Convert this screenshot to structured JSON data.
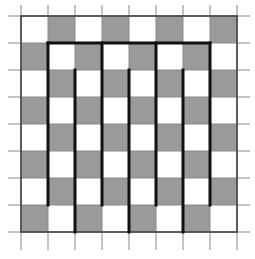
{
  "diagram": {
    "type": "checkerboard-with-meander-path",
    "rows": 8,
    "cols": 8,
    "origin": {
      "x": 21,
      "y": 16
    },
    "cell_size": 27,
    "tick_extent": {
      "x_min": 8,
      "x_max": 250,
      "y_min": 5,
      "y_max": 250
    },
    "colors": {
      "light_cell": "#ffffff",
      "dark_cell": "#9a9a9a",
      "grid_line": "#8a8a8a",
      "border_line": "#444444",
      "path_line": "#111111"
    },
    "dark_rule": "(row + col) is odd",
    "path_segments": [
      {
        "x1": 1,
        "y1": 1,
        "x2": 7,
        "y2": 1
      },
      {
        "x1": 1,
        "y1": 1,
        "x2": 1,
        "y2": 7
      },
      {
        "x1": 3,
        "y1": 1,
        "x2": 3,
        "y2": 7
      },
      {
        "x1": 5,
        "y1": 1,
        "x2": 5,
        "y2": 7
      },
      {
        "x1": 7,
        "y1": 1,
        "x2": 7,
        "y2": 7
      },
      {
        "x1": 2,
        "y1": 2,
        "x2": 2,
        "y2": 8
      },
      {
        "x1": 4,
        "y1": 2,
        "x2": 4,
        "y2": 8
      },
      {
        "x1": 6,
        "y1": 2,
        "x2": 6,
        "y2": 8
      }
    ]
  }
}
